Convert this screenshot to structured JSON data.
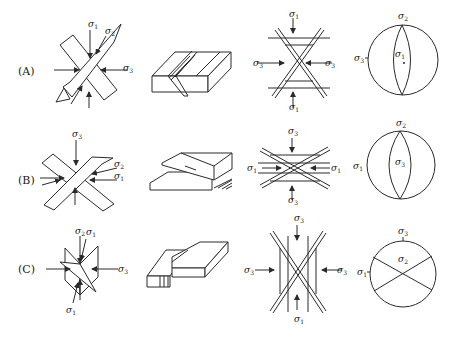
{
  "rows": [
    {
      "label": "(A)",
      "stress_panel": {
        "labels": [
          "σ1",
          "σ2",
          "σ3"
        ]
      },
      "conjugate_panel": {
        "top": "σ1",
        "bottom": "σ1",
        "left": "σ3",
        "right": "σ3"
      },
      "stereonet": {
        "top": "σ2",
        "left": "σ3",
        "center": "σ1"
      }
    },
    {
      "label": "(B)",
      "stress_panel": {
        "labels": [
          "σ3",
          "σ2",
          "σ1"
        ]
      },
      "conjugate_panel": {
        "top": "σ3",
        "bottom": "σ3",
        "left": "σ1",
        "right": "σ1"
      },
      "stereonet": {
        "top": "σ2",
        "left": "σ1",
        "center": "σ3"
      }
    },
    {
      "label": "(C)",
      "stress_panel": {
        "labels": [
          "σ2",
          "σ1",
          "σ3",
          "σ1"
        ]
      },
      "conjugate_panel": {
        "top": "σ3",
        "bottom": "σ1",
        "left": "σ3",
        "right": "σ3"
      },
      "stereonet": {
        "top": "σ3",
        "left": "σ1",
        "center": "σ2"
      }
    }
  ],
  "symbols": {
    "sigma": "σ",
    "s1": "1",
    "s2": "2",
    "s3": "3"
  }
}
